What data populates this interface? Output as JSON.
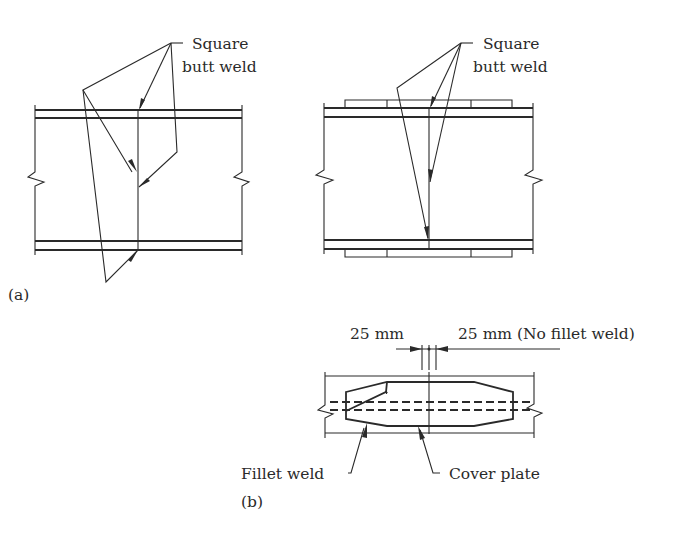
{
  "figure": {
    "panel_a": {
      "label": "(a)",
      "left_detail": {
        "weld_label_line1": "Square",
        "weld_label_line2": "butt weld"
      },
      "right_detail": {
        "weld_label_line1": "Square",
        "weld_label_line2": "butt weld"
      }
    },
    "panel_b": {
      "label": "(b)",
      "dim_left": "25 mm",
      "dim_right": "25 mm (No fillet weld)",
      "callout_fillet": "Fillet weld",
      "callout_cover": "Cover plate"
    }
  },
  "colors": {
    "line": "#2a2a2a",
    "background": "#ffffff"
  }
}
